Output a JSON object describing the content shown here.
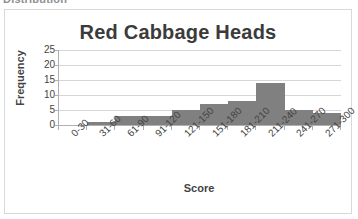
{
  "page": {
    "cutoff_heading": "Distribution"
  },
  "chart_data": {
    "type": "bar",
    "title": "Red Cabbage Heads",
    "xlabel": "Score",
    "ylabel": "Frequency",
    "categories": [
      "0-30",
      "31-60",
      "61-90",
      "91-120",
      "121-150",
      "151-180",
      "181-210",
      "211-240",
      "241-270",
      "271-300"
    ],
    "values": [
      0,
      1,
      3,
      3,
      5,
      7,
      8,
      14,
      5,
      4
    ],
    "yticks": [
      0,
      5,
      10,
      15,
      20,
      25
    ],
    "ylim": [
      0,
      25
    ],
    "grid": true,
    "legend": "none",
    "bar_color": "#808080",
    "gridline_color": "#d6d6d6",
    "axis_color": "#b0b0b0",
    "title_color": "#3b3b3b",
    "label_color": "#444444",
    "background": "#ffffff"
  }
}
